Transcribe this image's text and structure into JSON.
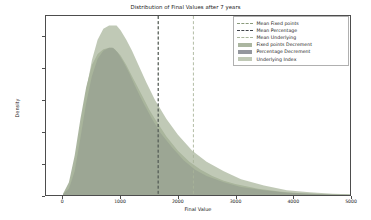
{
  "chart_data": {
    "type": "area",
    "title": "Distribution of Final Values after 7 years",
    "xlabel": "Final Value",
    "ylabel": "Density",
    "xlim": [
      -300,
      5000
    ],
    "ylim": [
      0,
      0.00113
    ],
    "grid": false,
    "legend_position": "upper right",
    "xticks": [
      "0",
      "1000",
      "2000",
      "3000",
      "4000",
      "5000"
    ],
    "xtick_values": [
      0,
      1000,
      2000,
      3000,
      4000,
      5000
    ],
    "yticks": [
      "0.0000",
      "0.0002",
      "0.0004",
      "0.0006",
      "0.0008",
      "0.0010"
    ],
    "ytick_values": [
      0.0,
      0.0002,
      0.0004,
      0.0006,
      0.0008,
      0.001
    ],
    "series": [
      {
        "name": "Fixed points Decrement",
        "kind": "filled_kde",
        "color": "#8a9a7b",
        "peak_x": 850,
        "peak_y": 0.00093,
        "x": [
          0,
          100,
          200,
          300,
          400,
          500,
          600,
          700,
          800,
          850,
          900,
          1000,
          1100,
          1200,
          1300,
          1400,
          1500,
          1600,
          1800,
          2000,
          2200,
          2400,
          2600,
          2800,
          3000,
          3400,
          3800,
          4200,
          4600,
          5000
        ],
        "values": [
          1e-05,
          8e-05,
          0.00025,
          0.00048,
          0.00068,
          0.00082,
          0.00089,
          0.00092,
          0.00093,
          0.00093,
          0.00092,
          0.00088,
          0.00082,
          0.00075,
          0.00068,
          0.00061,
          0.00054,
          0.00048,
          0.00037,
          0.00028,
          0.00021,
          0.00016,
          0.00012,
          9e-05,
          7e-05,
          4e-05,
          2e-05,
          1e-05,
          5e-06,
          2e-06
        ]
      },
      {
        "name": "Percentage Decrement",
        "kind": "filled_kde",
        "color": "#6b6f78",
        "peak_x": 870,
        "peak_y": 0.00093,
        "x": [
          0,
          100,
          200,
          300,
          400,
          500,
          600,
          700,
          800,
          870,
          950,
          1050,
          1150,
          1250,
          1400,
          1550,
          1700,
          1900,
          2100,
          2300,
          2500,
          2800,
          3100,
          3500,
          3900,
          4300,
          4700,
          5000
        ],
        "values": [
          5e-06,
          4e-05,
          0.00015,
          0.00036,
          0.00058,
          0.00075,
          0.00086,
          0.00091,
          0.00093,
          0.00093,
          0.0009,
          0.00084,
          0.00077,
          0.00069,
          0.00058,
          0.00048,
          0.00039,
          0.0003,
          0.00022,
          0.00016,
          0.00012,
          8e-05,
          5e-05,
          3e-05,
          1.5e-05,
          8e-06,
          3e-06,
          2e-06
        ]
      },
      {
        "name": "Underlying Index",
        "kind": "filled_kde",
        "color": "#a8b49a",
        "peak_x": 930,
        "peak_y": 0.00107,
        "x": [
          0,
          100,
          200,
          300,
          400,
          500,
          600,
          700,
          800,
          900,
          930,
          1000,
          1100,
          1200,
          1300,
          1450,
          1600,
          1800,
          2000,
          2250,
          2500,
          2800,
          3100,
          3500,
          3900,
          4300,
          4700,
          5000
        ],
        "values": [
          5e-06,
          5e-05,
          0.00018,
          0.00042,
          0.00066,
          0.00085,
          0.00098,
          0.00105,
          0.00107,
          0.00107,
          0.00107,
          0.00104,
          0.00098,
          0.00091,
          0.00083,
          0.00071,
          0.0006,
          0.00048,
          0.00038,
          0.00028,
          0.00021,
          0.00015,
          0.0001,
          6e-05,
          3e-05,
          1.8e-05,
          8e-06,
          5e-06
        ]
      }
    ],
    "mean_lines": [
      {
        "name": "Mean Fixed points",
        "x": 1660,
        "color": "#8a9a7b",
        "style": "dashed"
      },
      {
        "name": "Mean Percentage",
        "x": 1655,
        "color": "#3f434a",
        "style": "dashed"
      },
      {
        "name": "Mean Underlying",
        "x": 2270,
        "color": "#a8b49a",
        "style": "dashed"
      }
    ],
    "legend_entries": [
      {
        "label": "Mean Fixed points",
        "type": "line",
        "color": "#8a9a7b"
      },
      {
        "label": "Mean Percentage",
        "type": "line",
        "color": "#3f434a"
      },
      {
        "label": "Mean Underlying",
        "type": "line",
        "color": "#a8b49a"
      },
      {
        "label": "Fixed points Decrement",
        "type": "patch",
        "color": "#8a9a7b"
      },
      {
        "label": "Percentage Decrement",
        "type": "patch",
        "color": "#6b6f78"
      },
      {
        "label": "Underlying Index",
        "type": "patch",
        "color": "#a8b49a"
      }
    ]
  }
}
